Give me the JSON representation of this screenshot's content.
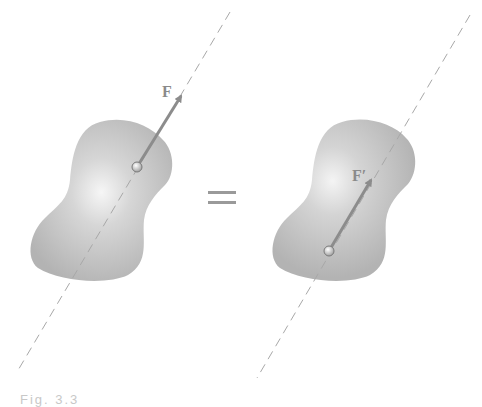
{
  "figure": {
    "left_panel": {
      "force_label": "F",
      "line_of_action": {
        "x1": 230,
        "y1": 12,
        "x2": 17,
        "y2": 372
      },
      "point_of_application": {
        "x": 137,
        "y": 167
      },
      "arrow_tip": {
        "x": 183,
        "y": 93
      }
    },
    "equals_sign": "=",
    "right_panel": {
      "force_label": "F′",
      "line_of_action": {
        "x1": 470,
        "y1": 15,
        "x2": 257,
        "y2": 378
      },
      "point_of_application": {
        "x": 329,
        "y": 251
      },
      "arrow_tip": {
        "x": 373,
        "y": 177
      }
    },
    "caption": "Fig. 3.3"
  },
  "colors": {
    "body_fill": "#b9b9b9",
    "body_highlight": "#f2f2f2",
    "arrow": "#8c8c8c",
    "dashed_line": "#a8a8a8",
    "label": "#8a8a8a"
  }
}
